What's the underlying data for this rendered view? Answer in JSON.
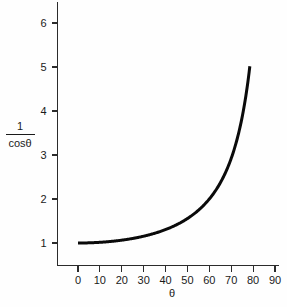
{
  "chart_data": {
    "type": "line",
    "title": "",
    "xlabel": "θ",
    "ylabel_numerator": "1",
    "ylabel_denominator": "cosθ",
    "ylabel": "1/cosθ",
    "xlim": [
      0,
      90
    ],
    "ylim": [
      0.55,
      6.75
    ],
    "grid": false,
    "legend": null,
    "x_ticks": [
      0,
      10,
      20,
      30,
      40,
      50,
      60,
      70,
      80,
      90
    ],
    "x_tick_labels": [
      "0",
      "10",
      "20",
      "30",
      "40",
      "50",
      "60",
      "70",
      "80",
      "90"
    ],
    "y_ticks": [
      1,
      2,
      3,
      4,
      5,
      6
    ],
    "y_tick_labels": [
      "1",
      "2",
      "3",
      "4",
      "5",
      "6"
    ],
    "series": [
      {
        "name": "1/cosθ",
        "color": "#0a0a0a",
        "x": [
          0,
          10,
          20,
          30,
          40,
          50,
          60,
          65,
          70,
          75,
          78.5
        ],
        "values": [
          1.0,
          1.02,
          1.06,
          1.15,
          1.31,
          1.5,
          2.0,
          2.37,
          3.0,
          3.86,
          6.75
        ]
      }
    ]
  },
  "axis": {
    "x_title": "θ",
    "y_title_numerator": "1",
    "y_title_denominator": "cosθ"
  },
  "colors": {
    "curve": "#0a0a0a",
    "axis": "#2b2b2b",
    "text": "#1a1a1a",
    "background": "#fefefe"
  }
}
